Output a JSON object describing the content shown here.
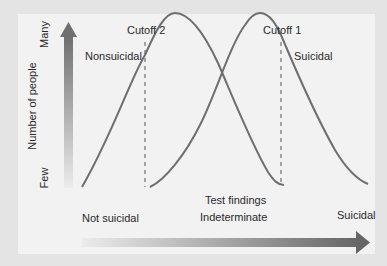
{
  "y_axis": {
    "label": "Number of people",
    "top_label": "Many",
    "bottom_label": "Few",
    "arrow_color_top": "#6f6f6f",
    "arrow_color_bottom": "#e6e6e6"
  },
  "x_axis": {
    "title": "Test findings",
    "left_label": "Not suicidal",
    "middle_label": "Indeterminate",
    "right_label": "Suicidal",
    "arrow_color_left": "#e8e8e8",
    "arrow_color_right": "#6a6a6a"
  },
  "curves": [
    {
      "name": "Nonsuicidal",
      "label": "Nonsuicidal",
      "color": "#6e6e6e"
    },
    {
      "name": "Suicidal",
      "label": "Suicidal",
      "color": "#6e6e6e"
    }
  ],
  "cutoffs": [
    {
      "label": "Cutoff 2"
    },
    {
      "label": "Cutoff 1"
    }
  ],
  "colors": {
    "background": "#e4e4e4",
    "panel": "#f2f2f2",
    "text": "#2a2a2a",
    "dashed_line": "#555555"
  }
}
